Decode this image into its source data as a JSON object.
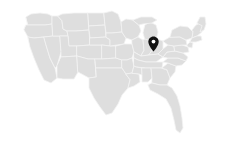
{
  "widget": {
    "name": "us-location-map",
    "width": 227,
    "height": 144,
    "background_color": "#ffffff",
    "alt_text": "Map of the contiguous United States with a location marker"
  },
  "map": {
    "region": "United States",
    "projection": "albers-usa",
    "land_fill_color": "#dedede",
    "border_stroke_color": "#f2f2f2",
    "border_stroke_width": 0.8,
    "bounds": {
      "left": 22,
      "top": 10,
      "right": 206,
      "bottom": 134
    },
    "state_count": 49
  },
  "markers": [
    {
      "name": "location-pin",
      "label": "Chicago, Illinois",
      "color": "#111111",
      "inner_dot_color": "#ffffff",
      "x": 153,
      "y": 52,
      "width": 11,
      "height": 16,
      "selected": true
    }
  ],
  "legend": {
    "visible": false,
    "items": []
  },
  "controls": {
    "zoom_visible": false,
    "attribution_visible": false
  }
}
